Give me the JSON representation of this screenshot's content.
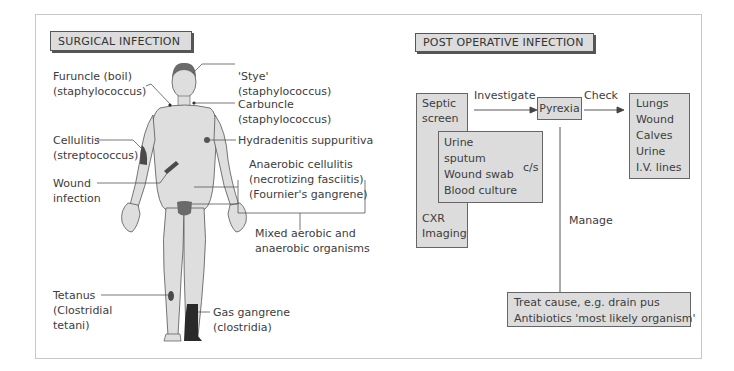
{
  "left_panel": {
    "title": "SURGICAL INFECTION",
    "labels": {
      "furuncle": [
        "Furuncle (boil)",
        "(staphylococcus)"
      ],
      "stye": [
        "'Stye'",
        "(staphylococcus)"
      ],
      "carbuncle": [
        "Carbuncle",
        "(staphylococcus)"
      ],
      "cellulitis": [
        "Cellulitis",
        "(streptococcus)"
      ],
      "hydradenitis": [
        "Hydradenitis suppuritiva"
      ],
      "wound": [
        "Wound",
        "infection"
      ],
      "anaerobic": [
        "Anaerobic cellulitis",
        "(necrotizing fasciitis)",
        "(Fournier's gangrene)"
      ],
      "mixed": [
        "Mixed aerobic and",
        "anaerobic organisms"
      ],
      "tetanus": [
        "Tetanus",
        "(Clostridial",
        "tetani)"
      ],
      "gas_gangrene": [
        "Gas gangrene",
        "(clostridia)"
      ]
    }
  },
  "right_panel": {
    "title": "POST OPERATIVE INFECTION",
    "septic_screen": [
      "Septic",
      "screen"
    ],
    "septic_imaging": [
      "CXR",
      "Imaging"
    ],
    "cs_tests": [
      "Urine",
      "sputum",
      "Wound swab",
      "Blood culture"
    ],
    "cs_label": "c/s",
    "investigate_label": "Investigate",
    "pyrexia": "Pyrexia",
    "check_label": "Check",
    "check_items": [
      "Lungs",
      "Wound",
      "Calves",
      "Urine",
      "I.V. lines"
    ],
    "manage_label": "Manage",
    "manage_items": [
      "Treat cause, e.g. drain pus",
      "Antibiotics 'most likely organism'"
    ]
  },
  "colors": {
    "box_fill": "#dcdcdc",
    "line": "#555555",
    "skin": "#dedede",
    "dark": "#2a2a2a"
  }
}
